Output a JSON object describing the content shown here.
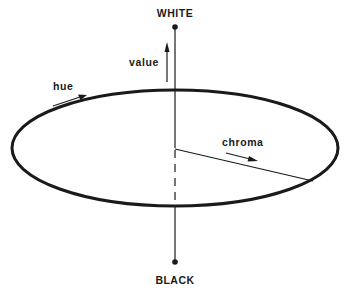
{
  "diagram": {
    "labels": {
      "top": "WHITE",
      "bottom": "BLACK",
      "value": "value",
      "hue": "hue",
      "chroma": "chroma"
    },
    "colors": {
      "ink": "#1a1a1a",
      "background": "#ffffff"
    }
  }
}
